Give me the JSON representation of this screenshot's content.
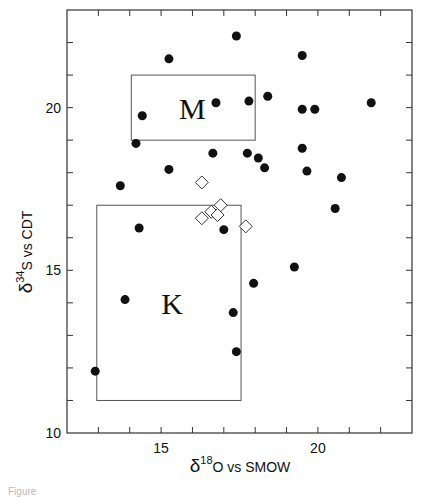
{
  "chart_data": {
    "type": "scatter",
    "title": "",
    "xlabel": "δ18O vs SMOW",
    "ylabel": "δ34S vs CDT",
    "xlabel_parts": {
      "delta": "δ",
      "sup": "18",
      "element": "O",
      "rest": "vs SMOW"
    },
    "ylabel_parts": {
      "delta": "δ",
      "sup": "34",
      "element": "S",
      "rest": "vs CDT"
    },
    "xlim": [
      12,
      23
    ],
    "ylim": [
      10,
      23
    ],
    "x_tick_labels": [
      {
        "value": 15,
        "label": "15"
      },
      {
        "value": 20,
        "label": "20"
      }
    ],
    "y_tick_labels": [
      {
        "value": 10,
        "label": "10"
      },
      {
        "value": 15,
        "label": "15"
      },
      {
        "value": 20,
        "label": "20"
      }
    ],
    "x_minor_ticks": [
      13,
      14,
      15,
      16,
      17,
      18,
      19,
      20,
      21,
      22
    ],
    "y_minor_ticks": [
      11,
      12,
      13,
      14,
      15,
      16,
      17,
      18,
      19,
      20,
      21,
      22
    ],
    "grid": false,
    "legend": null,
    "series": [
      {
        "name": "filled circles",
        "marker": "filled-circle",
        "points": [
          [
            17.4,
            22.2
          ],
          [
            15.25,
            21.5
          ],
          [
            19.5,
            21.6
          ],
          [
            14.4,
            19.75
          ],
          [
            16.75,
            20.15
          ],
          [
            17.8,
            20.2
          ],
          [
            18.4,
            20.35
          ],
          [
            19.5,
            19.95
          ],
          [
            19.9,
            19.95
          ],
          [
            21.7,
            20.15
          ],
          [
            14.2,
            18.9
          ],
          [
            15.25,
            18.1
          ],
          [
            13.7,
            17.6
          ],
          [
            16.65,
            18.6
          ],
          [
            17.75,
            18.6
          ],
          [
            18.1,
            18.45
          ],
          [
            18.3,
            18.15
          ],
          [
            19.5,
            18.75
          ],
          [
            19.65,
            18.05
          ],
          [
            20.75,
            17.85
          ],
          [
            20.55,
            16.9
          ],
          [
            14.3,
            16.3
          ],
          [
            17.0,
            16.25
          ],
          [
            19.25,
            15.1
          ],
          [
            17.95,
            14.6
          ],
          [
            17.3,
            13.7
          ],
          [
            17.4,
            12.5
          ],
          [
            13.85,
            14.1
          ],
          [
            12.9,
            11.9
          ]
        ]
      },
      {
        "name": "open diamonds",
        "marker": "open-diamond",
        "points": [
          [
            16.3,
            17.7
          ],
          [
            16.3,
            16.6
          ],
          [
            16.6,
            16.8
          ],
          [
            16.9,
            17.0
          ],
          [
            16.8,
            16.7
          ],
          [
            17.7,
            16.35
          ]
        ]
      }
    ],
    "regions": [
      {
        "label": "M",
        "x0": 14.05,
        "x1": 18.0,
        "y0": 19.0,
        "y1": 21.0,
        "label_pos": [
          16.0,
          20.0
        ]
      },
      {
        "label": "K",
        "x0": 12.95,
        "x1": 17.55,
        "y0": 11.0,
        "y1": 17.0,
        "label_pos": [
          15.35,
          14.0
        ]
      }
    ]
  },
  "caption": "Figure"
}
